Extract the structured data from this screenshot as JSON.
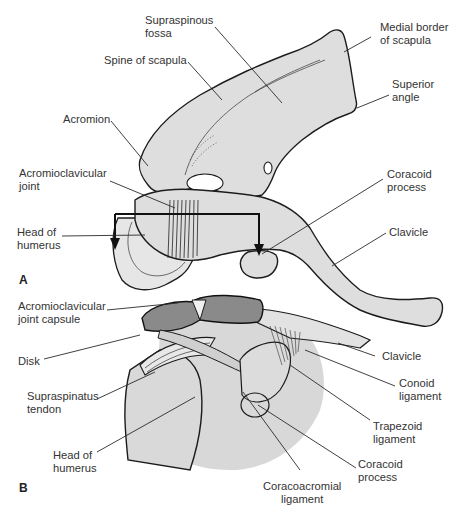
{
  "figure": {
    "panels": [
      {
        "id": "A",
        "label": "A"
      },
      {
        "id": "B",
        "label": "B"
      }
    ],
    "colors": {
      "bone_fill": "#dedede",
      "outline": "#1c1c1c",
      "shadow": "#d4d4d4",
      "label_text": "#333333",
      "background": "#ffffff"
    }
  },
  "panelA": {
    "labels": {
      "supraspinous_fossa_1": "Supraspinous",
      "supraspinous_fossa_2": "fossa",
      "medial_border_1": "Medial border",
      "medial_border_2": "of scapula",
      "spine_of_scapula": "Spine of scapula",
      "superior_angle_1": "Superior",
      "superior_angle_2": "angle",
      "acromion": "Acromion",
      "ac_joint_1": "Acromioclavicular",
      "ac_joint_2": "joint",
      "coracoid_process_1": "Coracoid",
      "coracoid_process_2": "process",
      "head_of_humerus_1": "Head of",
      "head_of_humerus_2": "humerus",
      "clavicle": "Clavicle"
    }
  },
  "panelB": {
    "labels": {
      "ac_joint_capsule_1": "Acromioclavicular",
      "ac_joint_capsule_2": "joint capsule",
      "disk": "Disk",
      "clavicle": "Clavicle",
      "supraspinatus_tendon_1": "Supraspinatus",
      "supraspinatus_tendon_2": "tendon",
      "conoid_ligament_1": "Conoid",
      "conoid_ligament_2": "ligament",
      "trapezoid_ligament_1": "Trapezoid",
      "trapezoid_ligament_2": "ligament",
      "head_of_humerus_1": "Head of",
      "head_of_humerus_2": "humerus",
      "coracoid_process_1": "Coracoid",
      "coracoid_process_2": "process",
      "coracoacromial_ligament_1": "Coracoacromial",
      "coracoacromial_ligament_2": "ligament"
    }
  }
}
